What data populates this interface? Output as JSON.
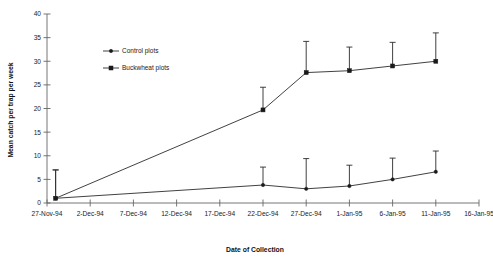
{
  "chart_data": {
    "type": "line",
    "title": "",
    "xlabel": "Date of Collection",
    "ylabel": "Mean catch per trap per week",
    "ylim": [
      0,
      40
    ],
    "ytick_labels": [
      "0",
      "5",
      "10",
      "15",
      "20",
      "25",
      "30",
      "35",
      "40"
    ],
    "ytick_values": [
      0,
      5,
      10,
      15,
      20,
      25,
      30,
      35,
      40
    ],
    "xtick_labels": [
      "27-Nov-94",
      "2-Dec-94",
      "7-Dec-94",
      "12-Dec-94",
      "17-Dec-94",
      "22-Dec-94",
      "27-Dec-94",
      "1-Jan-95",
      "6-Jan-95",
      "11-Jan-95",
      "16-Jan-95"
    ],
    "xtick_values": [
      0,
      5,
      10,
      15,
      20,
      25,
      30,
      35,
      40,
      45,
      50
    ],
    "xlim": [
      0,
      50
    ],
    "grid": false,
    "legend_position": "upper-left-inset",
    "series": [
      {
        "name": "Control plots",
        "marker": "dot",
        "x": [
          1,
          25,
          30,
          35,
          40,
          45
        ],
        "values": [
          1.0,
          3.8,
          3.0,
          3.6,
          5.0,
          6.6
        ],
        "errors_upper": [
          7.0,
          7.6,
          9.4,
          8.0,
          9.5,
          11.0
        ]
      },
      {
        "name": "Buckwheat plots",
        "marker": "square",
        "x": [
          1,
          25,
          30,
          35,
          40,
          45
        ],
        "values": [
          1.0,
          19.7,
          27.6,
          28.0,
          29.0,
          30.0
        ],
        "errors_upper": [
          7.0,
          24.5,
          34.2,
          33.0,
          34.0,
          36.0
        ]
      }
    ],
    "legend": [
      {
        "label": "Control plots",
        "marker": "dot"
      },
      {
        "label": "Buckwheat plots",
        "marker": "square"
      }
    ]
  }
}
